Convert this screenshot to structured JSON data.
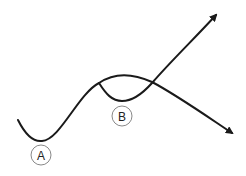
{
  "diagram": {
    "stroke_color": "#1a1a1a",
    "label_circle_color": "#888888",
    "markers": [
      {
        "id": "A",
        "label": "A"
      },
      {
        "id": "B",
        "label": "B"
      }
    ],
    "paths": [
      {
        "name": "main-curve",
        "description": "Wave from left dipping at A, rising to a peak, then descending to arrow at lower right"
      },
      {
        "name": "branch-curve",
        "description": "Branch leaving the peak, dipping at B, then rising to arrow at upper right"
      }
    ]
  }
}
